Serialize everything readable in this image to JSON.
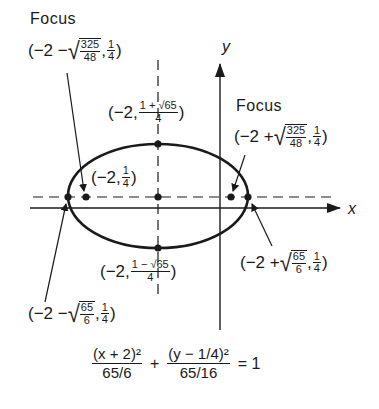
{
  "diagram": {
    "type": "ellipse-graph",
    "axes": {
      "x_label": "x",
      "y_label": "y"
    },
    "ellipse": {
      "center": {
        "label_prefix": "(−2, ",
        "num": "1",
        "den": "4",
        "suffix": ")"
      },
      "top_vertex": {
        "prefix": "(−2, ",
        "num": "1 + √65",
        "den": "4",
        "suffix": ")"
      },
      "bottom_vertex": {
        "prefix": "(−2, ",
        "num": "1 − √65",
        "den": "4",
        "suffix": ")"
      },
      "left_vertex": {
        "prefix": "(−2 − ",
        "rad_num": "65",
        "rad_den": "6",
        "sep": ", ",
        "num": "1",
        "den": "4",
        "suffix": ")"
      },
      "right_vertex": {
        "prefix": "(−2 + ",
        "rad_num": "65",
        "rad_den": "6",
        "sep": ", ",
        "num": "1",
        "den": "4",
        "suffix": ")"
      },
      "left_focus": {
        "title": "Focus",
        "prefix": "(−2 − ",
        "rad_num": "325",
        "rad_den": "48",
        "sep": ", ",
        "num": "1",
        "den": "4",
        "suffix": ")"
      },
      "right_focus": {
        "title": "Focus",
        "prefix": "(−2 + ",
        "rad_num": "325",
        "rad_den": "48",
        "sep": ", ",
        "num": "1",
        "den": "4",
        "suffix": ")"
      }
    },
    "equation": {
      "term1_num": "(x + 2)²",
      "term1_den": "65/6",
      "plus": "+",
      "term2_num": "(y − 1/4)²",
      "term2_den": "65/16",
      "equals": "= 1"
    },
    "colors": {
      "ink": "#1a1a1a",
      "background": "#ffffff"
    }
  }
}
